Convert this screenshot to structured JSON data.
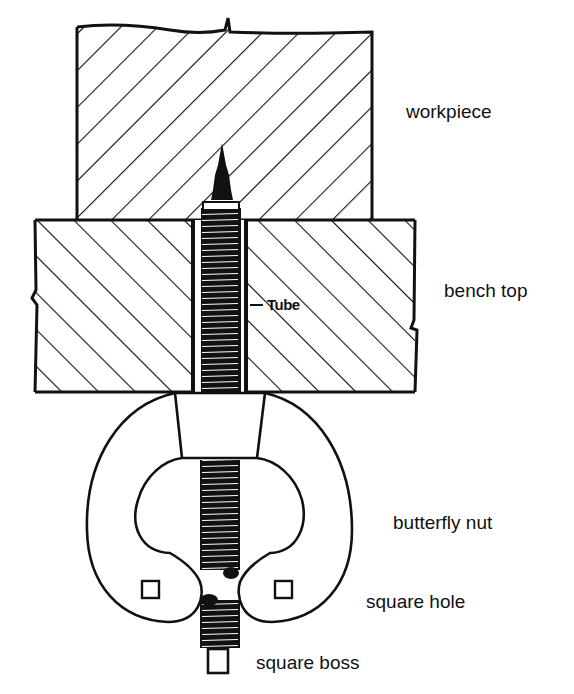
{
  "figure": {
    "type": "cross-section diagram",
    "colors": {
      "ink": "#111111",
      "background": "#ffffff"
    }
  },
  "labels": {
    "workpiece": "workpiece",
    "bench_top": "bench top",
    "tube": "Tube",
    "butterfly_nut": "butterfly nut",
    "square_hole": "square hole",
    "square_boss": "square boss"
  },
  "parts": [
    {
      "id": "workpiece",
      "hatch": "diagonal-up-right"
    },
    {
      "id": "bench_top",
      "hatch": "diagonal-down-right"
    },
    {
      "id": "tube",
      "content": "threaded screw with pointed spike"
    },
    {
      "id": "butterfly_nut",
      "features": [
        "two wings",
        "square holes in wings"
      ]
    },
    {
      "id": "square_boss",
      "position": "bottom of screw"
    }
  ]
}
